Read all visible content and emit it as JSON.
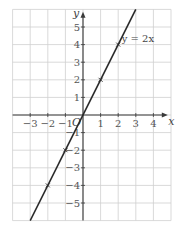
{
  "chart_data": {
    "type": "line",
    "title": "",
    "xlabel": "x",
    "ylabel": "y",
    "origin_label": "O",
    "xlim": [
      -4,
      5
    ],
    "ylim": [
      -6,
      6
    ],
    "grid": true,
    "x_ticks": [
      -3,
      -2,
      -1,
      1,
      2,
      3,
      4
    ],
    "x_tick_labels": [
      "−3",
      "−2",
      "−1",
      "1",
      "2",
      "3",
      "4"
    ],
    "y_ticks": [
      5,
      4,
      3,
      2,
      1,
      -1,
      -2,
      -3,
      -4,
      -5
    ],
    "y_tick_labels": [
      "5",
      "4",
      "3",
      "2",
      "1",
      "−1",
      "−2",
      "−3",
      "−4",
      "−5"
    ],
    "series": [
      {
        "name": "y = 2x",
        "equation": "y = 2x",
        "x": [
          -3,
          3
        ],
        "y": [
          -6,
          6
        ],
        "marked_points": [
          {
            "x": -2,
            "y": -4
          },
          {
            "x": -1,
            "y": -2
          },
          {
            "x": 1,
            "y": 2
          },
          {
            "x": 2,
            "y": 4
          }
        ],
        "color": "#2a2a2a"
      }
    ],
    "annotations": [
      {
        "text": "y = 2x",
        "x": 2.2,
        "y": 4
      }
    ],
    "colors": {
      "grid": "#cfcfcf",
      "axis": "#3a3a3a",
      "line": "#2a2a2a"
    }
  }
}
